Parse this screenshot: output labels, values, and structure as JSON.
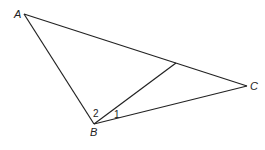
{
  "diagram": {
    "type": "geometry-triangle",
    "vertices": [
      "A",
      "B",
      "C"
    ],
    "segments": [
      "AB",
      "BC",
      "CA",
      "BD"
    ],
    "labels": {
      "A": "A",
      "B": "B",
      "C": "C"
    },
    "angle_labels": {
      "angle1": "1",
      "angle2": "2"
    }
  }
}
